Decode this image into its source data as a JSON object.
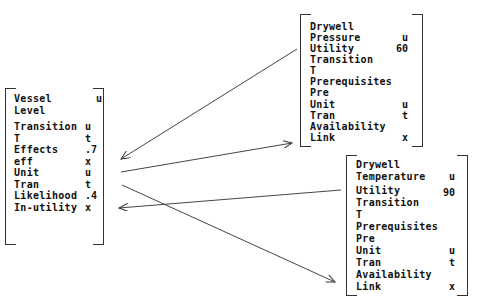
{
  "nodes": {
    "vessel": {
      "rows": [
        {
          "label": "Vessel",
          "value": "u"
        },
        {
          "label": "Level",
          "value": ""
        },
        {
          "label": "Transition",
          "value": "u"
        },
        {
          "label": "T",
          "value": "t"
        },
        {
          "label": "Effects",
          "value": ".7"
        },
        {
          "label": "eff",
          "value": "x"
        },
        {
          "label": "Unit",
          "value": "u"
        },
        {
          "label": "Tran",
          "value": "t"
        },
        {
          "label": "Likelihood",
          "value": ".4"
        },
        {
          "label": "In-utility",
          "value": "x"
        }
      ]
    },
    "pressure": {
      "rows": [
        {
          "label": "Drywell",
          "value": ""
        },
        {
          "label": "Pressure",
          "value": "u"
        },
        {
          "label": "Utility",
          "value": "60"
        },
        {
          "label": "Transition",
          "value": ""
        },
        {
          "label": "T",
          "value": ""
        },
        {
          "label": "Prerequisites",
          "value": ""
        },
        {
          "label": "Pre",
          "value": ""
        },
        {
          "label": "Unit",
          "value": "u"
        },
        {
          "label": "Tran",
          "value": "t"
        },
        {
          "label": "Availability",
          "value": ""
        },
        {
          "label": "Link",
          "value": "x"
        }
      ]
    },
    "temperature": {
      "rows": [
        {
          "label": "Drywell",
          "value": ""
        },
        {
          "label": "Temperature",
          "value": "u"
        },
        {
          "label": "Utility",
          "value": "90"
        },
        {
          "label": "Transition",
          "value": ""
        },
        {
          "label": "T",
          "value": ""
        },
        {
          "label": "Prerequisites",
          "value": ""
        },
        {
          "label": "Pre",
          "value": ""
        },
        {
          "label": "Unit",
          "value": "u"
        },
        {
          "label": "Tran",
          "value": "t"
        },
        {
          "label": "Availability",
          "value": ""
        },
        {
          "label": "Link",
          "value": "x"
        }
      ]
    }
  },
  "edges": [
    {
      "from": "pressure.link",
      "to": "vessel.eff",
      "label": ""
    },
    {
      "from": "vessel.unit",
      "to": "pressure.link",
      "label": ""
    },
    {
      "from": "temperature.utility",
      "to": "vessel.in-utility",
      "label": ""
    },
    {
      "from": "vessel.tran",
      "to": "temperature.link",
      "label": ""
    }
  ]
}
